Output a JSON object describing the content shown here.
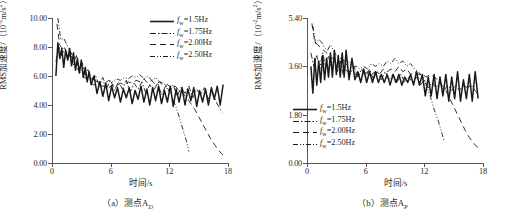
{
  "figure": {
    "panels": [
      {
        "caption": "（a）测点A",
        "caption_sub": "D",
        "axis": {
          "x_title": "时间/s",
          "y_title_main": "RMS加速度/（10",
          "y_title_exp": "-2",
          "y_title_tail": "m/s",
          "y_title_tail_exp": "2",
          "y_title_close": "）",
          "x_ticks": [
            "0",
            "6",
            "12",
            "18"
          ],
          "y_ticks": [
            "0.00",
            "2.00",
            "4.00",
            "6.00",
            "8.00",
            "10.00"
          ]
        },
        "legend_position": "top-right",
        "legend": [
          {
            "label_prefix": "f",
            "label_sub": "w",
            "label_value": "=1.5Hz",
            "style": "solid"
          },
          {
            "label_prefix": "f",
            "label_sub": "w",
            "label_value": "=1.75Hz",
            "style": "dashdot"
          },
          {
            "label_prefix": "f",
            "label_sub": "w",
            "label_value": "=2.00Hz",
            "style": "dashed"
          },
          {
            "label_prefix": "f",
            "label_sub": "w",
            "label_value": "=2.50Hz",
            "style": "dashdotdot"
          }
        ]
      },
      {
        "caption": "（b）测点A",
        "caption_sub": "P",
        "axis": {
          "x_title": "时间/s",
          "y_title_main": "RMS加速度/（10",
          "y_title_exp": "-2",
          "y_title_tail": "m/s",
          "y_title_tail_exp": "2",
          "y_title_close": "）",
          "x_ticks": [
            "0",
            "6",
            "12",
            "18"
          ],
          "y_ticks": [
            "0.00",
            "1.80",
            "3.60",
            "5.40"
          ]
        },
        "legend_position": "bottom-left",
        "legend": [
          {
            "label_prefix": "f",
            "label_sub": "w",
            "label_value": "=1.5Hz",
            "style": "solid"
          },
          {
            "label_prefix": "f",
            "label_sub": "w",
            "label_value": "=1.75Hz",
            "style": "dashdot"
          },
          {
            "label_prefix": "f",
            "label_sub": "w",
            "label_value": "=2.00Hz",
            "style": "dashed"
          },
          {
            "label_prefix": "f",
            "label_sub": "w",
            "label_value": "=2.50Hz",
            "style": "dashdotdot"
          }
        ]
      }
    ]
  },
  "chart_data": [
    {
      "type": "line",
      "title": "（a）测点A_D",
      "xlabel": "时间/s",
      "ylabel": "RMS加速度/（10^-2 m/s^2）",
      "xlim": [
        0,
        18
      ],
      "ylim": [
        0,
        10
      ],
      "xticks": [
        0,
        6,
        12,
        18
      ],
      "yticks": [
        0,
        2,
        4,
        6,
        8,
        10
      ],
      "grid": false,
      "legend_position": "upper right",
      "series": [
        {
          "name": "f_w=1.5Hz",
          "style": "solid",
          "x": [
            0.4,
            0.6,
            0.8,
            1.0,
            1.2,
            1.4,
            1.6,
            1.8,
            2.0,
            2.2,
            2.4,
            2.6,
            2.8,
            3.0,
            3.2,
            3.4,
            3.6,
            3.8,
            4.0,
            4.3,
            4.6,
            4.9,
            5.2,
            5.5,
            5.8,
            6.1,
            6.4,
            6.7,
            7.0,
            7.3,
            7.6,
            7.9,
            8.2,
            8.5,
            8.8,
            9.1,
            9.4,
            9.7,
            10.0,
            10.3,
            10.6,
            10.9,
            11.2,
            11.5,
            11.8,
            12.1,
            12.4,
            12.7,
            13.0,
            13.3,
            13.6,
            13.9,
            14.2,
            14.5,
            14.8,
            15.1,
            15.4,
            15.7,
            16.0,
            16.3,
            16.6,
            16.9,
            17.2,
            17.5
          ],
          "y": [
            6.0,
            8.3,
            7.2,
            7.9,
            6.6,
            7.8,
            7.1,
            7.9,
            6.7,
            7.6,
            6.4,
            7.2,
            6.2,
            7.1,
            5.9,
            6.6,
            5.6,
            6.3,
            5.4,
            6.0,
            4.8,
            5.6,
            4.6,
            5.5,
            4.3,
            5.3,
            4.5,
            5.2,
            4.2,
            5.1,
            4.5,
            5.2,
            4.1,
            5.0,
            4.4,
            5.3,
            4.2,
            5.1,
            4.0,
            5.2,
            4.3,
            5.3,
            4.1,
            5.0,
            4.2,
            5.3,
            3.9,
            5.1,
            4.2,
            5.2,
            4.0,
            5.1,
            4.3,
            5.2,
            3.9,
            5.0,
            4.2,
            5.1,
            4.0,
            5.2,
            4.4,
            5.3,
            4.0,
            5.4
          ]
        },
        {
          "name": "f_w=1.75Hz",
          "style": "dashdot",
          "x": [
            0.4,
            0.7,
            1.0,
            1.3,
            1.6,
            1.9,
            2.2,
            2.5,
            2.8,
            3.1,
            3.4,
            3.7,
            4.0,
            4.4,
            4.8,
            5.2,
            5.6,
            6.0,
            6.4,
            6.8,
            7.2,
            7.6,
            8.0,
            8.4,
            8.8,
            9.2,
            9.6,
            10.0,
            10.4,
            10.8,
            11.2,
            11.6,
            12.0,
            12.4,
            12.8,
            13.2,
            13.6,
            14.0,
            14.4,
            14.8,
            15.2,
            15.6,
            16.0,
            16.4,
            16.8,
            17.2,
            17.4
          ],
          "y": [
            7.0,
            8.0,
            7.4,
            8.0,
            7.1,
            7.6,
            6.9,
            7.4,
            6.4,
            6.9,
            6.1,
            6.5,
            5.7,
            6.1,
            5.4,
            5.9,
            5.2,
            5.7,
            5.0,
            5.6,
            5.1,
            5.7,
            4.9,
            5.5,
            5.1,
            5.6,
            4.8,
            5.4,
            5.0,
            5.5,
            4.7,
            5.3,
            4.9,
            5.4,
            4.6,
            5.2,
            4.8,
            5.3,
            4.5,
            5.1,
            4.7,
            5.2,
            4.4,
            4.9,
            4.2,
            3.7,
            3.5
          ]
        },
        {
          "name": "f_w=2.00Hz",
          "style": "dashed",
          "x": [
            0.5,
            0.8,
            1.1,
            1.4,
            1.7,
            2.0,
            2.3,
            2.6,
            2.9,
            3.2,
            3.5,
            3.8,
            4.2,
            4.6,
            5.0,
            5.4,
            5.8,
            6.2,
            6.6,
            7.0,
            7.4,
            7.8,
            8.2,
            8.6,
            9.0,
            9.4,
            9.8,
            10.2,
            10.6,
            11.0,
            11.4,
            11.8,
            12.2,
            12.6,
            13.0,
            13.4,
            13.8,
            14.2,
            14.6,
            15.0,
            15.4,
            15.8,
            16.2,
            16.6,
            17.0,
            17.4,
            17.8
          ],
          "y": [
            9.6,
            8.1,
            7.9,
            7.6,
            7.3,
            7.0,
            6.7,
            6.5,
            6.2,
            6.0,
            5.8,
            5.6,
            5.4,
            5.4,
            5.3,
            5.3,
            5.2,
            5.4,
            5.3,
            5.5,
            5.4,
            5.6,
            5.5,
            5.7,
            5.6,
            5.8,
            5.5,
            5.7,
            5.4,
            5.6,
            5.3,
            5.4,
            5.2,
            5.3,
            5.0,
            4.8,
            4.5,
            4.1,
            3.7,
            3.2,
            2.7,
            2.2,
            1.7,
            1.3,
            0.9,
            0.6,
            0.35
          ]
        },
        {
          "name": "f_w=2.50Hz",
          "style": "dashdotdot",
          "x": [
            0.6,
            0.9,
            1.2,
            1.5,
            1.8,
            2.1,
            2.4,
            2.7,
            3.0,
            3.4,
            3.8,
            4.2,
            4.6,
            5.0,
            5.4,
            5.8,
            6.2,
            6.6,
            7.0,
            7.4,
            7.8,
            8.2,
            8.6,
            9.0,
            9.4,
            9.8,
            10.2,
            10.6,
            11.0,
            11.4,
            11.8,
            12.2,
            12.6,
            13.0,
            13.4,
            13.8,
            14.0
          ],
          "y": [
            10.0,
            8.5,
            8.6,
            8.2,
            7.8,
            7.4,
            7.0,
            6.7,
            6.4,
            6.1,
            5.9,
            5.8,
            5.6,
            5.6,
            5.5,
            5.7,
            5.6,
            5.8,
            5.7,
            5.9,
            5.8,
            6.0,
            5.9,
            6.1,
            5.8,
            6.0,
            5.7,
            5.9,
            5.6,
            5.5,
            5.2,
            4.7,
            4.0,
            3.2,
            2.3,
            1.4,
            0.8
          ]
        }
      ]
    },
    {
      "type": "line",
      "title": "（b）测点A_P",
      "xlabel": "时间/s",
      "ylabel": "RMS加速度/（10^-2 m/s^2）",
      "xlim": [
        0,
        18
      ],
      "ylim": [
        0,
        5.4
      ],
      "xticks": [
        0,
        6,
        12,
        18
      ],
      "yticks": [
        0,
        1.8,
        3.6,
        5.4
      ],
      "grid": false,
      "legend_position": "lower left",
      "series": [
        {
          "name": "f_w=1.5Hz",
          "style": "solid",
          "x": [
            0.4,
            0.6,
            0.8,
            1.0,
            1.2,
            1.4,
            1.6,
            1.8,
            2.0,
            2.2,
            2.4,
            2.6,
            2.8,
            3.0,
            3.2,
            3.4,
            3.6,
            3.8,
            4.0,
            4.3,
            4.6,
            4.9,
            5.2,
            5.5,
            5.8,
            6.1,
            6.4,
            6.7,
            7.0,
            7.3,
            7.6,
            7.9,
            8.2,
            8.5,
            8.8,
            9.1,
            9.4,
            9.7,
            10.0,
            10.3,
            10.6,
            10.9,
            11.2,
            11.5,
            11.8,
            12.1,
            12.4,
            12.7,
            13.0,
            13.3,
            13.6,
            13.9,
            14.2,
            14.5,
            14.8,
            15.1,
            15.4,
            15.7,
            16.0,
            16.3,
            16.6,
            16.9,
            17.2,
            17.5
          ],
          "y": [
            3.6,
            2.6,
            3.9,
            2.9,
            3.8,
            3.0,
            4.0,
            3.1,
            3.9,
            3.2,
            4.1,
            3.2,
            4.2,
            3.3,
            4.0,
            3.2,
            4.1,
            3.2,
            4.2,
            3.1,
            3.9,
            3.1,
            3.4,
            3.0,
            3.5,
            3.0,
            3.4,
            3.0,
            3.4,
            3.0,
            3.3,
            3.0,
            3.3,
            2.9,
            3.3,
            3.0,
            3.3,
            2.9,
            3.2,
            3.0,
            3.3,
            2.9,
            3.4,
            2.9,
            3.3,
            2.5,
            3.2,
            2.5,
            3.3,
            2.4,
            3.2,
            2.5,
            3.3,
            2.3,
            3.2,
            2.4,
            3.4,
            2.3,
            3.1,
            2.4,
            3.3,
            2.3,
            3.4,
            2.4
          ]
        },
        {
          "name": "f_w=1.75Hz",
          "style": "dashdot",
          "x": [
            0.4,
            0.7,
            1.0,
            1.3,
            1.6,
            1.9,
            2.2,
            2.5,
            2.8,
            3.1,
            3.4,
            3.7,
            4.0,
            4.4,
            4.8,
            5.2,
            5.6,
            6.0,
            6.4,
            6.8,
            7.2,
            7.6,
            8.0,
            8.4,
            8.8,
            9.2,
            9.6,
            10.0,
            10.4,
            10.8,
            11.2,
            11.6,
            12.0,
            12.4,
            12.8,
            13.2,
            13.6,
            14.0,
            14.4,
            14.8,
            15.2,
            15.6,
            16.0,
            16.4,
            16.8,
            17.2,
            17.4
          ],
          "y": [
            4.1,
            3.6,
            4.0,
            3.5,
            4.1,
            3.6,
            4.0,
            3.5,
            3.9,
            3.4,
            3.8,
            3.3,
            3.7,
            3.3,
            3.6,
            3.2,
            3.5,
            3.2,
            3.5,
            3.1,
            3.4,
            3.1,
            3.4,
            3.1,
            3.3,
            3.0,
            3.3,
            3.0,
            3.2,
            3.0,
            3.2,
            2.9,
            3.1,
            2.8,
            3.0,
            2.8,
            3.0,
            2.7,
            2.9,
            2.7,
            2.9,
            2.7,
            2.9,
            2.8,
            2.9,
            2.7,
            2.6
          ]
        },
        {
          "name": "f_w=2.00Hz",
          "style": "dashed",
          "x": [
            0.5,
            0.8,
            1.1,
            1.4,
            1.7,
            2.0,
            2.3,
            2.6,
            2.9,
            3.2,
            3.5,
            3.8,
            4.2,
            4.6,
            5.0,
            5.4,
            5.8,
            6.2,
            6.6,
            7.0,
            7.4,
            7.8,
            8.2,
            8.6,
            9.0,
            9.4,
            9.8,
            10.2,
            10.6,
            11.0,
            11.4,
            11.8,
            12.2,
            12.6,
            13.0,
            13.4,
            13.8,
            14.2,
            14.6,
            15.0,
            15.4,
            15.8,
            16.2,
            16.6,
            17.0,
            17.4,
            17.7
          ],
          "y": [
            5.2,
            4.5,
            4.4,
            4.3,
            4.2,
            4.1,
            4.0,
            3.9,
            3.8,
            3.7,
            3.6,
            3.5,
            3.4,
            3.4,
            3.3,
            3.3,
            3.3,
            3.4,
            3.3,
            3.4,
            3.3,
            3.5,
            3.4,
            3.5,
            3.4,
            3.6,
            3.4,
            3.5,
            3.3,
            3.4,
            3.3,
            3.3,
            3.2,
            3.3,
            3.2,
            3.1,
            2.9,
            2.7,
            2.4,
            2.1,
            1.8,
            1.5,
            1.2,
            0.95,
            0.75,
            0.6,
            0.5
          ]
        },
        {
          "name": "f_w=2.50Hz",
          "style": "dashdotdot",
          "x": [
            0.6,
            0.9,
            1.2,
            1.5,
            1.8,
            2.1,
            2.4,
            2.7,
            3.0,
            3.4,
            3.8,
            4.2,
            4.6,
            5.0,
            5.4,
            5.8,
            6.2,
            6.6,
            7.0,
            7.4,
            7.8,
            8.2,
            8.6,
            9.0,
            9.4,
            9.8,
            10.2,
            10.6,
            11.0,
            11.4,
            11.8,
            12.2,
            12.6,
            13.0,
            13.4,
            13.8,
            14.0
          ],
          "y": [
            5.1,
            4.4,
            4.6,
            4.5,
            4.3,
            4.2,
            4.4,
            4.2,
            4.0,
            3.9,
            3.8,
            3.8,
            3.6,
            3.6,
            3.5,
            3.6,
            3.5,
            3.7,
            3.6,
            3.7,
            3.6,
            3.8,
            3.7,
            3.9,
            3.7,
            3.8,
            3.6,
            3.7,
            3.5,
            3.4,
            3.2,
            2.9,
            2.5,
            2.0,
            1.6,
            1.1,
            0.85
          ]
        }
      ]
    }
  ]
}
